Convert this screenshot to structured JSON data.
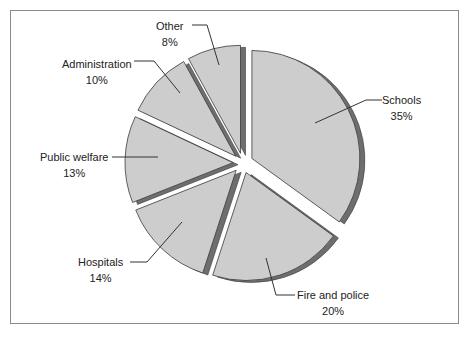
{
  "chart_data": {
    "type": "pie",
    "title": "",
    "style": "exploded 3D pie",
    "start_angle_deg": 0,
    "direction": "clockwise",
    "categories": [
      "Schools",
      "Fire and police",
      "Hospitals",
      "Public welfare",
      "Administration",
      "Other"
    ],
    "values": [
      35,
      20,
      14,
      13,
      10,
      8
    ],
    "labels": [
      "35%",
      "20%",
      "14%",
      "13%",
      "10%",
      "8%"
    ],
    "legend": "none (callout labels)",
    "colors": {
      "face": "#cdcdcd",
      "side": "#6e6e6e",
      "outline": "#3a3a3a",
      "frame": "#8a8a8a"
    }
  },
  "labels": {
    "schools": {
      "name": "Schools",
      "pct": "35%"
    },
    "fire": {
      "name": "Fire and police",
      "pct": "20%"
    },
    "hospitals": {
      "name": "Hospitals",
      "pct": "14%"
    },
    "welfare": {
      "name": "Public welfare",
      "pct": "13%"
    },
    "admin": {
      "name": "Administration",
      "pct": "10%"
    },
    "other": {
      "name": "Other",
      "pct": "8%"
    }
  }
}
